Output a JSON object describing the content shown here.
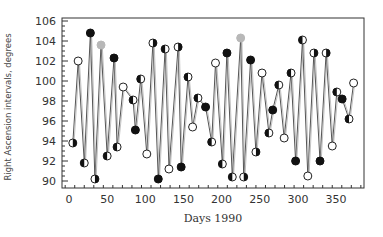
{
  "chart_data": {
    "type": "line",
    "title": "",
    "xlabel": "Days 1990",
    "ylabel": "Right Ascension intervals, degrees",
    "xlim": [
      -10,
      385
    ],
    "ylim": [
      90,
      106
    ],
    "xticks": [
      0,
      50,
      100,
      150,
      200,
      250,
      300,
      350
    ],
    "yticks": [
      90,
      92,
      94,
      96,
      98,
      100,
      102,
      104,
      106
    ],
    "grid": false,
    "legend": null,
    "marker_types": [
      "open",
      "filled",
      "gray",
      "half-left",
      "half-right"
    ],
    "colors": {
      "line": "#555555",
      "marker_fill": "#111111",
      "marker_gray": "#b0b0b0",
      "axis": "#333333"
    },
    "series": [
      {
        "name": "Right Ascension intervals",
        "points": [
          {
            "x": 5,
            "y": 93.8,
            "m": "half-right"
          },
          {
            "x": 12,
            "y": 102.0,
            "m": "open"
          },
          {
            "x": 20,
            "y": 91.8,
            "m": "half-left"
          },
          {
            "x": 28,
            "y": 104.8,
            "m": "filled"
          },
          {
            "x": 34,
            "y": 90.2,
            "m": "half-right"
          },
          {
            "x": 42,
            "y": 103.6,
            "m": "gray"
          },
          {
            "x": 50,
            "y": 92.5,
            "m": "half-left"
          },
          {
            "x": 59,
            "y": 102.3,
            "m": "filled"
          },
          {
            "x": 63,
            "y": 93.4,
            "m": "half-left"
          },
          {
            "x": 71,
            "y": 99.4,
            "m": "open"
          },
          {
            "x": 84,
            "y": 98.1,
            "m": "half-left"
          },
          {
            "x": 87,
            "y": 95.1,
            "m": "filled"
          },
          {
            "x": 94,
            "y": 100.2,
            "m": "half-left"
          },
          {
            "x": 102,
            "y": 92.7,
            "m": "open"
          },
          {
            "x": 110,
            "y": 103.8,
            "m": "half-right"
          },
          {
            "x": 117,
            "y": 90.2,
            "m": "filled"
          },
          {
            "x": 126,
            "y": 103.2,
            "m": "half-left"
          },
          {
            "x": 131,
            "y": 91.2,
            "m": "open"
          },
          {
            "x": 143,
            "y": 103.4,
            "m": "half-right"
          },
          {
            "x": 147,
            "y": 91.4,
            "m": "filled"
          },
          {
            "x": 156,
            "y": 100.4,
            "m": "half-left"
          },
          {
            "x": 162,
            "y": 95.4,
            "m": "open"
          },
          {
            "x": 169,
            "y": 98.3,
            "m": "half-left"
          },
          {
            "x": 179,
            "y": 97.4,
            "m": "filled"
          },
          {
            "x": 187,
            "y": 93.9,
            "m": "half-left"
          },
          {
            "x": 192,
            "y": 101.8,
            "m": "open"
          },
          {
            "x": 201,
            "y": 91.7,
            "m": "half-left"
          },
          {
            "x": 207,
            "y": 102.8,
            "m": "filled"
          },
          {
            "x": 214,
            "y": 90.4,
            "m": "half-left"
          },
          {
            "x": 225,
            "y": 104.3,
            "m": "gray"
          },
          {
            "x": 229,
            "y": 90.4,
            "m": "half-right"
          },
          {
            "x": 238,
            "y": 102.1,
            "m": "filled"
          },
          {
            "x": 245,
            "y": 92.9,
            "m": "half-right"
          },
          {
            "x": 253,
            "y": 100.8,
            "m": "open"
          },
          {
            "x": 262,
            "y": 94.8,
            "m": "half-left"
          },
          {
            "x": 267,
            "y": 97.1,
            "m": "filled"
          },
          {
            "x": 275,
            "y": 99.6,
            "m": "half-left"
          },
          {
            "x": 282,
            "y": 94.3,
            "m": "open"
          },
          {
            "x": 291,
            "y": 100.8,
            "m": "half-left"
          },
          {
            "x": 297,
            "y": 92.0,
            "m": "filled"
          },
          {
            "x": 306,
            "y": 104.1,
            "m": "half-left"
          },
          {
            "x": 313,
            "y": 90.5,
            "m": "open"
          },
          {
            "x": 321,
            "y": 102.8,
            "m": "half-right"
          },
          {
            "x": 329,
            "y": 92.0,
            "m": "filled"
          },
          {
            "x": 337,
            "y": 102.8,
            "m": "half-right"
          },
          {
            "x": 345,
            "y": 93.5,
            "m": "open"
          },
          {
            "x": 351,
            "y": 98.9,
            "m": "half-left"
          },
          {
            "x": 358,
            "y": 98.2,
            "m": "filled"
          },
          {
            "x": 367,
            "y": 96.2,
            "m": "half-left"
          },
          {
            "x": 373,
            "y": 99.8,
            "m": "open"
          }
        ]
      }
    ]
  }
}
